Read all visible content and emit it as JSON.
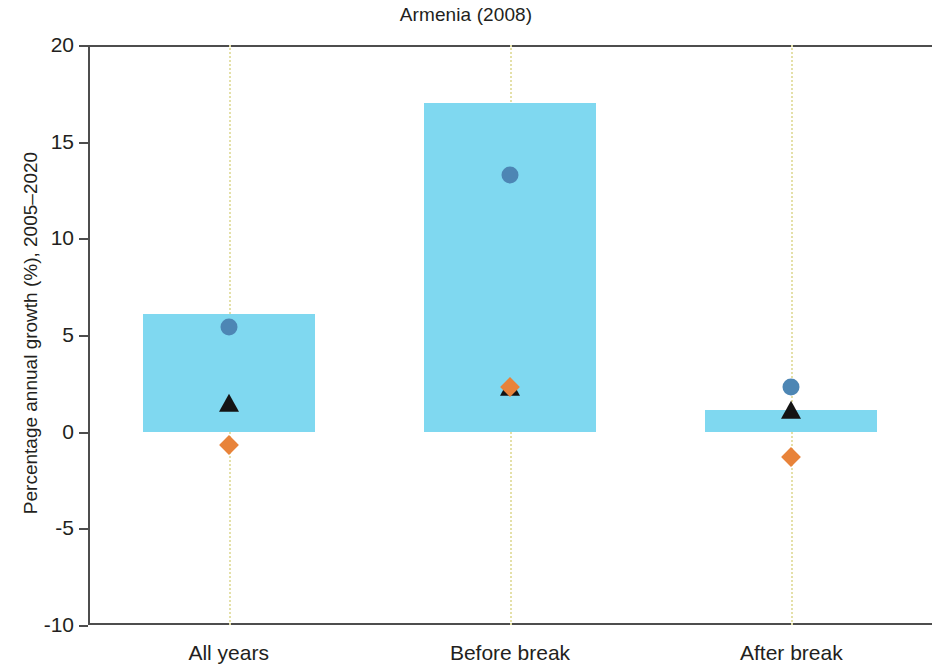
{
  "chart_data": {
    "type": "bar",
    "title": "Armenia (2008)",
    "xlabel": "",
    "ylabel": "Percentage annual growth (%), 2005–2020",
    "categories": [
      "All years",
      "Before break",
      "After break"
    ],
    "ylim": [
      -10,
      20
    ],
    "yticks": [
      20,
      15,
      10,
      5,
      0,
      -5,
      -10
    ],
    "ytick_labels": [
      "20",
      "15",
      "10",
      "5",
      "0",
      "-5",
      "-10"
    ],
    "grid": "vertical-dotted-at-categories",
    "legend": "none",
    "series": [
      {
        "name": "Range bar",
        "marker": "bar",
        "color": "#7FD8F0",
        "values": [
          6.1,
          17.0,
          1.1
        ]
      },
      {
        "name": "Maximum",
        "marker": "circle",
        "color": "#4D86B4",
        "values": [
          5.4,
          13.3,
          2.3
        ]
      },
      {
        "name": "Mean",
        "marker": "triangle",
        "color": "#141414",
        "values": [
          1.4,
          2.2,
          1.0
        ]
      },
      {
        "name": "Minimum",
        "marker": "diamond",
        "color": "#E8833A",
        "values": [
          -0.7,
          2.3,
          -1.3
        ]
      }
    ]
  },
  "colors": {
    "bar_fill": "#7FD8F0",
    "circle_marker": "#4D86B4",
    "triangle_marker": "#141414",
    "diamond_marker": "#E8833A",
    "gridline": "#E4E0A8",
    "axis": "#4D4D4D",
    "text": "#231F20",
    "background": "#FFFFFF"
  }
}
